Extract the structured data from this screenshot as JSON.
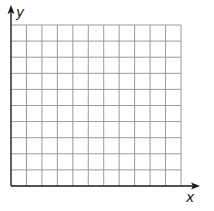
{
  "diagram": {
    "type": "coordinate-grid",
    "x_axis": {
      "label": "x",
      "arrow": true
    },
    "y_axis": {
      "label": "y",
      "arrow": true
    },
    "grid": {
      "columns": 11,
      "rows": 10
    },
    "colors": {
      "grid": "#9a9a9a",
      "axis": "#1a1a1a",
      "background": "#ffffff"
    }
  }
}
